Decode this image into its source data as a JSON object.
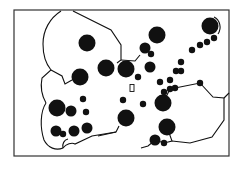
{
  "diagram": {
    "title": "",
    "colors": {
      "ink": "#111111",
      "background": "#ffffff",
      "frame": "#333333"
    },
    "nodes": [
      {
        "id": "n1",
        "x": 87,
        "y": 43,
        "size": "large"
      },
      {
        "id": "n2",
        "x": 80,
        "y": 77,
        "size": "large"
      },
      {
        "id": "n3",
        "x": 106,
        "y": 68,
        "size": "large"
      },
      {
        "id": "n4",
        "x": 126,
        "y": 69,
        "size": "large"
      },
      {
        "id": "n5",
        "x": 157,
        "y": 35,
        "size": "large"
      },
      {
        "id": "n6",
        "x": 145,
        "y": 48,
        "size": "medium"
      },
      {
        "id": "n7",
        "x": 210,
        "y": 26,
        "size": "large"
      },
      {
        "id": "n8",
        "x": 57,
        "y": 108,
        "size": "large"
      },
      {
        "id": "n9",
        "x": 71,
        "y": 111,
        "size": "medium"
      },
      {
        "id": "n10",
        "x": 56,
        "y": 131,
        "size": "medium"
      },
      {
        "id": "n11",
        "x": 63,
        "y": 134,
        "size": "small"
      },
      {
        "id": "n12",
        "x": 74,
        "y": 131,
        "size": "medium"
      },
      {
        "id": "n13",
        "x": 87,
        "y": 128,
        "size": "medium"
      },
      {
        "id": "n14",
        "x": 126,
        "y": 118,
        "size": "large"
      },
      {
        "id": "n15",
        "x": 167,
        "y": 127,
        "size": "large"
      },
      {
        "id": "n16",
        "x": 163,
        "y": 103,
        "size": "large"
      },
      {
        "id": "n17",
        "x": 155,
        "y": 140,
        "size": "medium"
      },
      {
        "id": "n18",
        "x": 164,
        "y": 143,
        "size": "small"
      },
      {
        "id": "n19",
        "x": 150,
        "y": 67,
        "size": "medium"
      },
      {
        "id": "n20",
        "x": 151,
        "y": 54,
        "size": "small"
      },
      {
        "id": "n21",
        "x": 138,
        "y": 77,
        "size": "small"
      },
      {
        "id": "n22",
        "x": 143,
        "y": 104,
        "size": "small"
      },
      {
        "id": "n23",
        "x": 123,
        "y": 100,
        "size": "small"
      },
      {
        "id": "n24",
        "x": 83,
        "y": 99,
        "size": "small"
      },
      {
        "id": "n25",
        "x": 86,
        "y": 112,
        "size": "small"
      },
      {
        "id": "n26",
        "x": 164,
        "y": 92,
        "size": "small"
      },
      {
        "id": "n27",
        "x": 170,
        "y": 80,
        "size": "small"
      },
      {
        "id": "n28",
        "x": 176,
        "y": 71,
        "size": "small"
      },
      {
        "id": "n29",
        "x": 181,
        "y": 71,
        "size": "small"
      },
      {
        "id": "n30",
        "x": 170,
        "y": 89,
        "size": "small"
      },
      {
        "id": "n31",
        "x": 181,
        "y": 62,
        "size": "small"
      },
      {
        "id": "n32",
        "x": 192,
        "y": 50,
        "size": "small"
      },
      {
        "id": "n33",
        "x": 200,
        "y": 45,
        "size": "small"
      },
      {
        "id": "n34",
        "x": 207,
        "y": 42,
        "size": "small"
      },
      {
        "id": "n35",
        "x": 214,
        "y": 38,
        "size": "small"
      },
      {
        "id": "n36",
        "x": 200,
        "y": 83,
        "size": "small"
      },
      {
        "id": "n37",
        "x": 175,
        "y": 88,
        "size": "small"
      },
      {
        "id": "n38",
        "x": 160,
        "y": 82,
        "size": "small"
      }
    ],
    "marker": {
      "label": "rectangle-marker",
      "x": 132,
      "y": 88
    }
  }
}
